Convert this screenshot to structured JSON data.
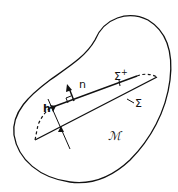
{
  "diagram": {
    "type": "domain-with-thin-layer",
    "colors": {
      "stroke": "#111111",
      "background": "#ffffff"
    },
    "labels": {
      "normal": "n",
      "thickness": "h",
      "upper_surface": "Σ",
      "upper_surface_sup": "+",
      "lower_surface": "Σ",
      "domain": "ℳ"
    }
  }
}
